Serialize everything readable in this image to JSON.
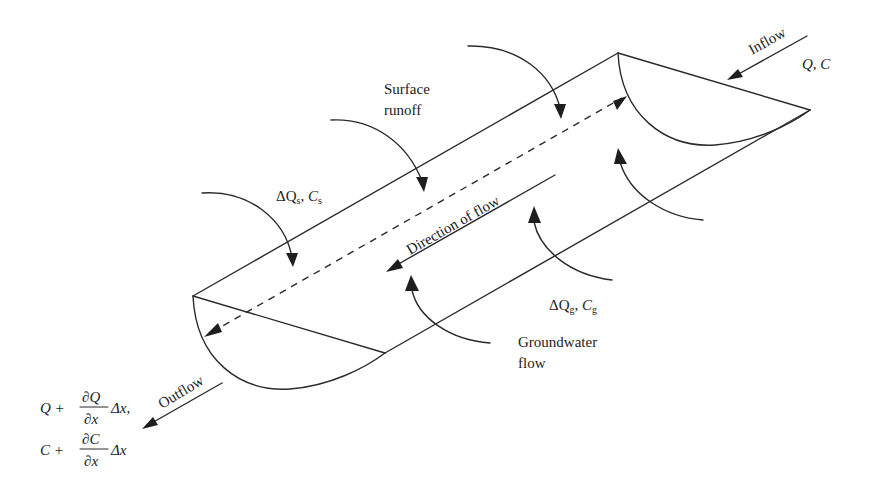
{
  "diagram": {
    "labels": {
      "inflow": "Inflow",
      "inflow_vars": "Q, C",
      "surface_runoff_line1": "Surface",
      "surface_runoff_line2": "runoff",
      "surface_delta": "ΔQ",
      "surface_delta_sub": "s",
      "surface_conc": "C",
      "surface_conc_sub": "s",
      "direction": "Direction of flow",
      "groundwater_delta": "ΔQ",
      "groundwater_delta_sub": "g",
      "groundwater_conc": "C",
      "groundwater_conc_sub": "g",
      "groundwater_line1": "Groundwater",
      "groundwater_line2": "flow",
      "outflow": "Outflow",
      "outflow_q_base": "Q +",
      "outflow_q_num": "∂Q",
      "outflow_q_den": "∂x",
      "outflow_q_tail": "Δx,",
      "outflow_c_base": "C +",
      "outflow_c_num": "∂C",
      "outflow_c_den": "∂x",
      "outflow_c_tail": "Δx"
    },
    "colors": {
      "line": "#2a2a2a",
      "text": "#222222",
      "background": "#ffffff"
    }
  }
}
